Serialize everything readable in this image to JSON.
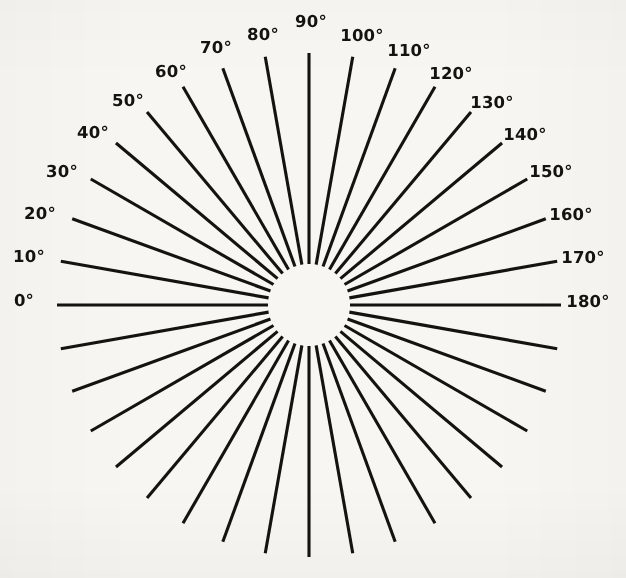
{
  "figure": {
    "background_color": "#f7f6f3",
    "ink_color": "#15130f",
    "center_x": 309,
    "center_y": 305,
    "inner_radius": 41,
    "outer_radius": 252,
    "ray_count": 36,
    "ray_step_degrees": 10,
    "ray_width": 3.1,
    "label_count": 19,
    "label_radius": 276
  },
  "chart_data": {
    "type": "scatter",
    "title": "",
    "subtitle": "",
    "xlabel": "",
    "ylabel": "",
    "grid": false,
    "legend": null,
    "angle_unit": "degree",
    "angle_start": 0,
    "angle_end": 350,
    "angle_step": 10,
    "labeled_angles": [
      0,
      10,
      20,
      30,
      40,
      50,
      60,
      70,
      80,
      90,
      100,
      110,
      120,
      130,
      140,
      150,
      160,
      170,
      180
    ],
    "unlabeled_angles": [
      190,
      200,
      210,
      220,
      230,
      240,
      250,
      260,
      270,
      280,
      290,
      300,
      310,
      320,
      330,
      340,
      350
    ],
    "labels": [
      {
        "angle": 0,
        "text": "0°",
        "x": 24,
        "y": 301
      },
      {
        "angle": 10,
        "text": "10°",
        "x": 29,
        "y": 257
      },
      {
        "angle": 20,
        "text": "20°",
        "x": 40,
        "y": 214
      },
      {
        "angle": 30,
        "text": "30°",
        "x": 62,
        "y": 172
      },
      {
        "angle": 40,
        "text": "40°",
        "x": 93,
        "y": 133
      },
      {
        "angle": 50,
        "text": "50°",
        "x": 128,
        "y": 101
      },
      {
        "angle": 60,
        "text": "60°",
        "x": 171,
        "y": 72
      },
      {
        "angle": 70,
        "text": "70°",
        "x": 216,
        "y": 48
      },
      {
        "angle": 80,
        "text": "80°",
        "x": 263,
        "y": 35
      },
      {
        "angle": 90,
        "text": "90°",
        "x": 311,
        "y": 22
      },
      {
        "angle": 100,
        "text": "100°",
        "x": 362,
        "y": 36
      },
      {
        "angle": 110,
        "text": "110°",
        "x": 409,
        "y": 51
      },
      {
        "angle": 120,
        "text": "120°",
        "x": 451,
        "y": 74
      },
      {
        "angle": 130,
        "text": "130°",
        "x": 492,
        "y": 103
      },
      {
        "angle": 140,
        "text": "140°",
        "x": 525,
        "y": 135
      },
      {
        "angle": 150,
        "text": "150°",
        "x": 551,
        "y": 172
      },
      {
        "angle": 160,
        "text": "160°",
        "x": 571,
        "y": 215
      },
      {
        "angle": 170,
        "text": "170°",
        "x": 583,
        "y": 258
      },
      {
        "angle": 180,
        "text": "180°",
        "x": 588,
        "y": 302
      }
    ]
  }
}
